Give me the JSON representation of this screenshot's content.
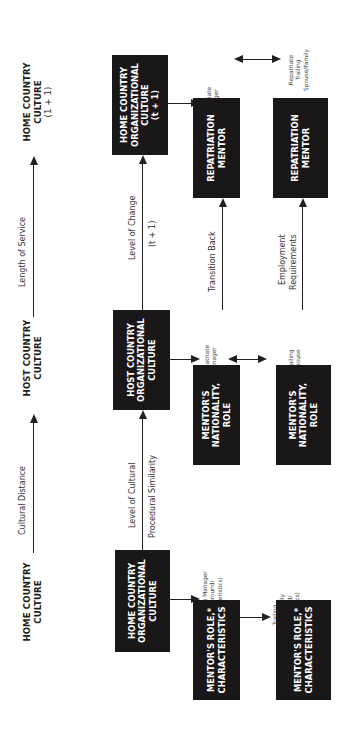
{
  "top_row": {
    "home_culture": [
      "HOME COUNTRY",
      "CULTURE"
    ],
    "arrow1_label": "Cultural Distance",
    "host_culture": [
      "HOST COUNTRY",
      "CULTURE"
    ],
    "arrow2_label": "Length of Service",
    "home_culture_next": [
      "HOME COUNTRY",
      "CULTURE",
      "(1 + 1)"
    ]
  },
  "org_row": {
    "home_org": [
      "HOME COUNTRY",
      "ORGANIZATIONAL",
      "CULTURE"
    ],
    "arrow1_label_line1": "Level of Cultural",
    "arrow1_label_line2": "Procedural Similarity",
    "host_org": [
      "HOST COUNTRY",
      "ORGANIZATIONAL",
      "CULTURE"
    ],
    "arrow2_label_line1": "Level of Change",
    "arrow2_label_line2": "(t + 1)",
    "home_org_next": [
      "HOME COUNTRY",
      "ORGANIZATIONAL",
      "CULTURE",
      "(t + 1)"
    ]
  },
  "people": {
    "expat_manager": [
      "Expatriate Manager",
      "(Background/",
      "Characteristics)"
    ],
    "trailing_family": [
      "Trailing",
      "Spouse/Family",
      "(Background/",
      "Characteristics)"
    ],
    "expat_manager_host": [
      "Expatriate",
      "Manager"
    ],
    "trailing_spouse_host": [
      "Trailing",
      "Spouse"
    ],
    "repatriate_manager": [
      "Repatriate",
      "Manager"
    ],
    "repatriate_family": [
      "Repatriate",
      "Trailing",
      "Spouse/Family"
    ]
  },
  "mentor_row1": {
    "mentor_role": [
      "MENTOR'S ROLE,*",
      "CHARACTERISTICS"
    ],
    "mentor_nationality": [
      "MENTOR'S",
      "NATIONALITY,",
      "ROLE"
    ],
    "transition_label": "Transition Back",
    "repatriation": [
      "REPATRIATION",
      "MENTOR"
    ]
  },
  "mentor_row2": {
    "mentor_role": [
      "MENTOR'S ROLE,*",
      "CHARACTERISTICS"
    ],
    "mentor_nationality": [
      "MENTOR'S",
      "NATIONALITY,",
      "ROLE"
    ],
    "employment_label_line1": "Employment",
    "employment_label_line2": "Requirements",
    "repatriation": [
      "REPATRIATION",
      "MENTOR"
    ]
  }
}
